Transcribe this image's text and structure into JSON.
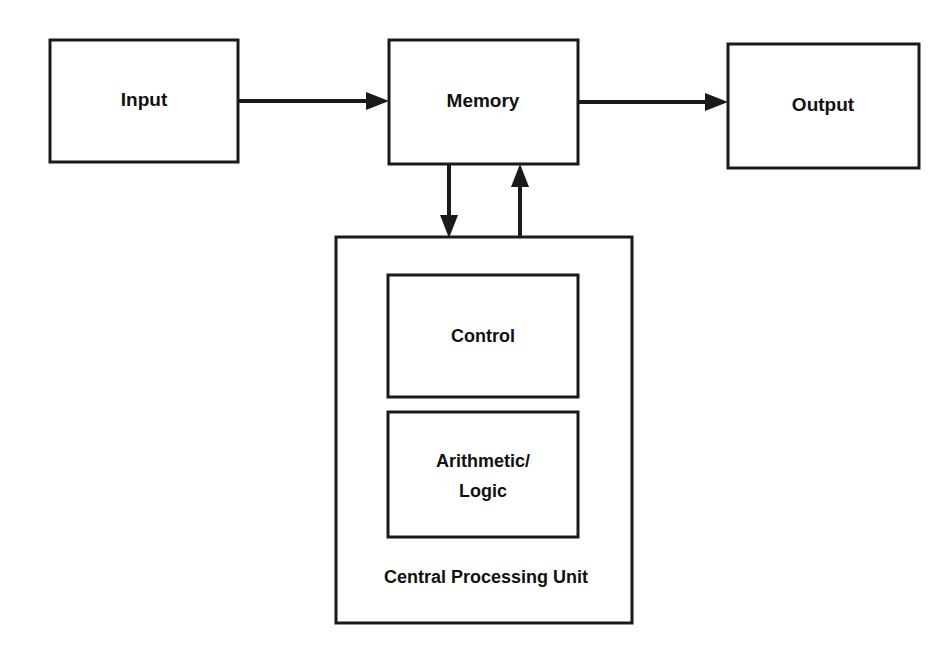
{
  "diagram": {
    "type": "block-diagram",
    "background_color": "#ffffff",
    "line_color": "#1a1a1a",
    "text_color": "#111111",
    "nodes": [
      {
        "id": "input",
        "label": "Input",
        "x": 50,
        "y": 40,
        "w": 188,
        "h": 122
      },
      {
        "id": "memory",
        "label": "Memory",
        "x": 389,
        "y": 40,
        "w": 189,
        "h": 124
      },
      {
        "id": "output",
        "label": "Output",
        "x": 728,
        "y": 44,
        "w": 191,
        "h": 124
      },
      {
        "id": "cpu",
        "label": "Central Processing Unit",
        "x": 336,
        "y": 237,
        "w": 296,
        "h": 386
      },
      {
        "id": "control",
        "label": "Control",
        "x": 388,
        "y": 275,
        "w": 190,
        "h": 122
      },
      {
        "id": "alu",
        "label": "Arithmetic/ Logic",
        "label_line1": "Arithmetic/",
        "label_line2": "Logic",
        "x": 388,
        "y": 412,
        "w": 190,
        "h": 125
      }
    ],
    "edges": [
      {
        "id": "input-to-memory",
        "from": "input",
        "to": "memory",
        "direction": "right"
      },
      {
        "id": "memory-to-output",
        "from": "memory",
        "to": "output",
        "direction": "right"
      },
      {
        "id": "memory-to-cpu",
        "from": "memory",
        "to": "cpu",
        "direction": "down"
      },
      {
        "id": "cpu-to-memory",
        "from": "cpu",
        "to": "memory",
        "direction": "up"
      }
    ]
  },
  "labels": {
    "input": "Input",
    "memory": "Memory",
    "output": "Output",
    "control": "Control",
    "alu_line1": "Arithmetic/",
    "alu_line2": "Logic",
    "cpu_caption": "Central Processing Unit"
  }
}
